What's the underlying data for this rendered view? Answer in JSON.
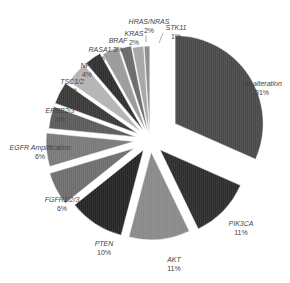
{
  "chart_data": {
    "type": "pie",
    "title": "",
    "exploded": true,
    "start_angle_deg": 0,
    "direction": "clockwise",
    "slices": [
      {
        "label": "No alteration",
        "percent_label": "31%",
        "value": 31,
        "color": "#4a4a4a"
      },
      {
        "label": "PIK3CA",
        "percent_label": "11%",
        "value": 11,
        "color": "#2e2e2e"
      },
      {
        "label": "AKT",
        "percent_label": "11%",
        "value": 11,
        "color": "#8a8a8a"
      },
      {
        "label": "PTEN",
        "percent_label": "10%",
        "value": 10,
        "color": "#262626"
      },
      {
        "label": "FGFR1/2/3",
        "percent_label": "6%",
        "value": 6,
        "color": "#6e6e6e"
      },
      {
        "label": "EGFR Amplification",
        "percent_label": "6%",
        "value": 6,
        "color": "#7a7a7a"
      },
      {
        "label": "ERBB2/3",
        "percent_label": "4%",
        "value": 4,
        "color": "#5c5c5c"
      },
      {
        "label": "TSC1/2",
        "percent_label": "4%",
        "value": 4,
        "color": "#3a3a3a"
      },
      {
        "label": "NF1",
        "percent_label": "4%",
        "value": 4,
        "color": "#b4b4b4"
      },
      {
        "label": "RASA1",
        "percent_label": "3%",
        "value": 3,
        "color": "#303030"
      },
      {
        "label": "BRAF",
        "percent_label": "3%",
        "value": 3,
        "color": "#9a9a9a"
      },
      {
        "label": "KRAS",
        "percent_label": "2%",
        "value": 2,
        "color": "#6a6a6a"
      },
      {
        "label": "HRAS/NRAS",
        "percent_label": "2%",
        "value": 2,
        "color": "#a6a6a6"
      },
      {
        "label": "STK11",
        "percent_label": "1%",
        "value": 1,
        "color": "#8c8c8c"
      }
    ],
    "legend": "none (labels placed around slices)"
  },
  "labels": {
    "no_alteration": {
      "name": "No alteration",
      "pct": "31%"
    },
    "pik3ca": {
      "name": "PIK3CA",
      "pct": "11%"
    },
    "akt": {
      "name": "AKT",
      "pct": "11%"
    },
    "pten": {
      "name": "PTEN",
      "pct": "10%"
    },
    "fgfr": {
      "name": "FGFR1/2/3",
      "pct": "6%"
    },
    "egfr": {
      "name": "EGFR Amplification",
      "pct": "6%"
    },
    "erbb": {
      "name": "ERBB2/3",
      "pct": "4%"
    },
    "tsc": {
      "name": "TSC1/2",
      "pct": "4%"
    },
    "nf1": {
      "name": "NF1",
      "pct": "4%"
    },
    "rasa1": {
      "name": "RASA1",
      "pct": "3%"
    },
    "braf": {
      "name": "BRAF",
      "pct": "3%"
    },
    "kras": {
      "name": "KRAS",
      "pct": "2%"
    },
    "hras": {
      "name": "HRAS/NRAS",
      "pct": "2%"
    },
    "stk11": {
      "name": "STK11",
      "pct": "1%"
    }
  }
}
